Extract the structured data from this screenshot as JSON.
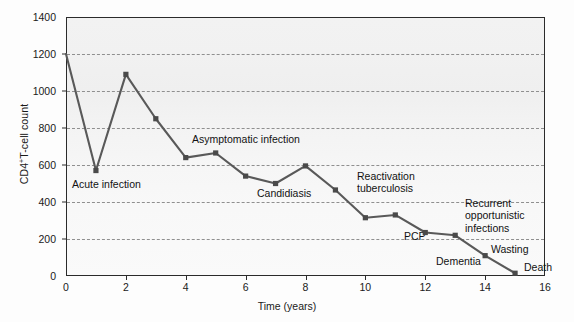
{
  "chart_data": {
    "type": "line",
    "title": "",
    "xlabel": "Time (years)",
    "ylabel": "CD4+T-cell count",
    "ylabel_parts": {
      "prefix": "CD4",
      "sup": "+",
      "suffix": "T-cell count"
    },
    "xlim": [
      0,
      16
    ],
    "ylim": [
      0,
      1400
    ],
    "xticks": [
      0,
      2,
      4,
      6,
      8,
      10,
      12,
      14,
      16
    ],
    "xtick_labels": [
      "0",
      "2",
      "4",
      "6",
      "8",
      "10",
      "12",
      "14",
      "16"
    ],
    "yticks": [
      0,
      200,
      400,
      600,
      800,
      1000,
      1200,
      1400
    ],
    "ytick_labels": [
      "0",
      "200",
      "400",
      "600",
      "800",
      "1000",
      "1200",
      "1400"
    ],
    "gridlines": [
      200,
      400,
      600,
      800,
      1000,
      1200
    ],
    "grid": true,
    "grid_style": "dashed-horizontal",
    "legend": "none",
    "series": [
      {
        "name": "CD4+ T-cell count",
        "color": "#595959",
        "marker": "square",
        "x": [
          0,
          1,
          2,
          3,
          4,
          5,
          6,
          7,
          8,
          9,
          10,
          11,
          12,
          13,
          14,
          15
        ],
        "values": [
          1200,
          570,
          1090,
          850,
          640,
          665,
          540,
          500,
          595,
          465,
          315,
          330,
          235,
          220,
          110,
          15
        ]
      }
    ],
    "annotations": [
      {
        "id": "acute-infection",
        "lines": [
          "Acute infection"
        ],
        "x_px": 72,
        "y_px": 178
      },
      {
        "id": "asymptomatic-infection",
        "lines": [
          "Asymptomatic infection"
        ],
        "x_px": 192,
        "y_px": 133
      },
      {
        "id": "candidiasis",
        "lines": [
          "Candidiasis"
        ],
        "x_px": 257,
        "y_px": 187
      },
      {
        "id": "reactivation-tuberculosis",
        "lines": [
          "Reactivation",
          "tuberculosis"
        ],
        "x_px": 357,
        "y_px": 170
      },
      {
        "id": "recurrent-opportunistic-infections",
        "lines": [
          "Recurrent",
          "opportunistic",
          "infections"
        ],
        "x_px": 465,
        "y_px": 197
      },
      {
        "id": "pcp",
        "lines": [
          "PCP"
        ],
        "x_px": 404,
        "y_px": 230
      },
      {
        "id": "wasting",
        "lines": [
          "Wasting"
        ],
        "x_px": 491,
        "y_px": 243
      },
      {
        "id": "dementia",
        "lines": [
          "Dementia"
        ],
        "x_px": 436,
        "y_px": 255
      },
      {
        "id": "death",
        "lines": [
          "Death"
        ],
        "x_px": 524,
        "y_px": 261
      }
    ]
  },
  "colors": {
    "line": "#595959",
    "marker": "#4a4a4a",
    "frame": "#2b2b2b",
    "grid": "#8f8f8f",
    "text": "#1a1a1a",
    "plot_background": "#f4f4f4"
  }
}
